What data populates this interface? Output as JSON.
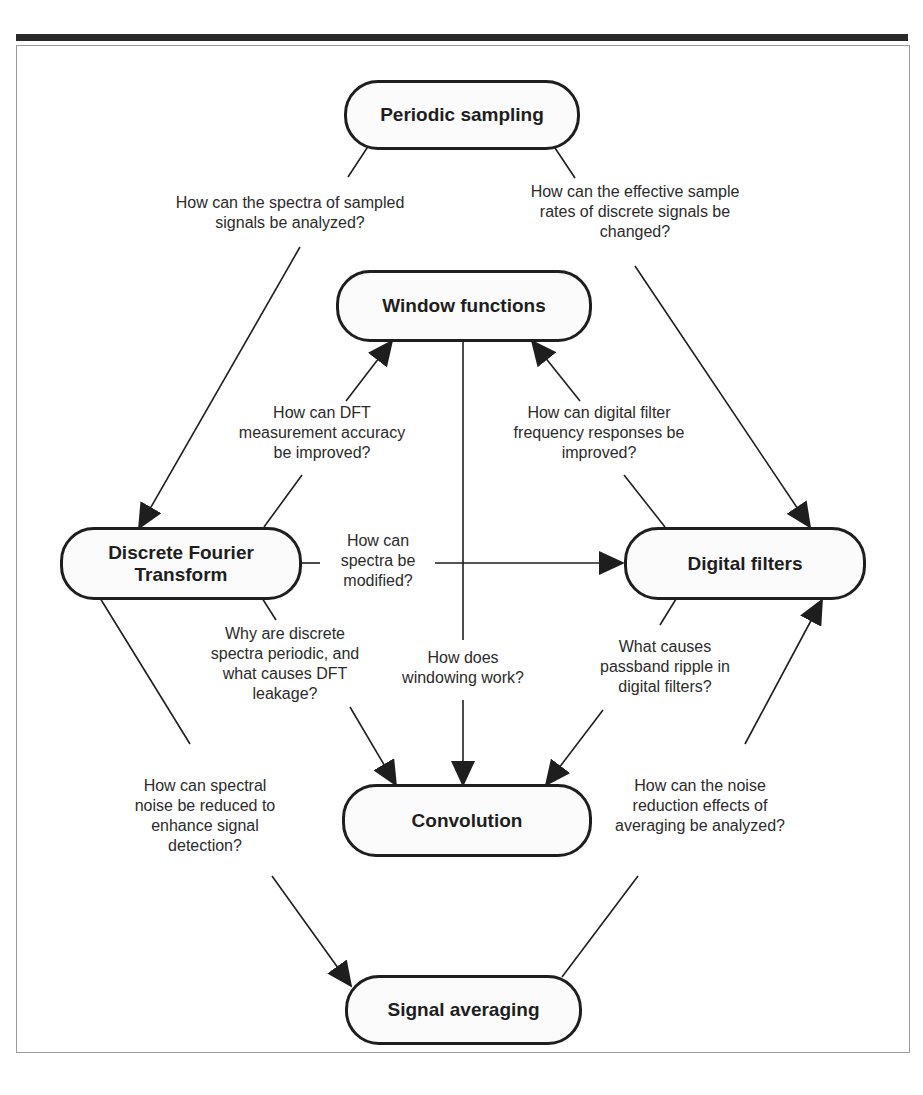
{
  "diagram": {
    "nodes": {
      "periodic_sampling": "Periodic sampling",
      "window_functions": "Window functions",
      "dft_line1": "Discrete Fourier",
      "dft_line2": "Transform",
      "digital_filters": "Digital filters",
      "convolution": "Convolution",
      "signal_averaging": "Signal averaging"
    },
    "questions": {
      "q_spectra_sampled": [
        "How can the spectra of sampled",
        "signals be analyzed?"
      ],
      "q_sample_rates": [
        "How can the effective sample",
        "rates of discrete signals be",
        "changed?"
      ],
      "q_dft_accuracy": [
        "How can DFT",
        "measurement accuracy",
        "be improved?"
      ],
      "q_filter_response": [
        "How can digital filter",
        "frequency responses be",
        "improved?"
      ],
      "q_spectra_modified": [
        "How can",
        "spectra be",
        "modified?"
      ],
      "q_periodic_leakage": [
        "Why are discrete",
        "spectra periodic, and",
        "what causes DFT",
        "leakage?"
      ],
      "q_windowing": [
        "How does",
        "windowing work?"
      ],
      "q_passband_ripple": [
        "What causes",
        "passband ripple in",
        "digital filters?"
      ],
      "q_spectral_noise": [
        "How can spectral",
        "noise be reduced to",
        "enhance signal",
        "detection?"
      ],
      "q_noise_reduction": [
        "How can the noise",
        "reduction effects of",
        "averaging be analyzed?"
      ]
    },
    "edges": [
      {
        "from": "Periodic sampling",
        "to": "Discrete Fourier Transform",
        "label": "q_spectra_sampled"
      },
      {
        "from": "Periodic sampling",
        "to": "Digital filters",
        "label": "q_sample_rates"
      },
      {
        "from": "Discrete Fourier Transform",
        "to": "Window functions",
        "label": "q_dft_accuracy"
      },
      {
        "from": "Digital filters",
        "to": "Window functions",
        "label": "q_filter_response"
      },
      {
        "from": "Discrete Fourier Transform",
        "to": "Digital filters",
        "label": "q_spectra_modified"
      },
      {
        "from": "Discrete Fourier Transform",
        "to": "Convolution",
        "label": "q_periodic_leakage"
      },
      {
        "from": "Window functions",
        "to": "Convolution",
        "label": "q_windowing"
      },
      {
        "from": "Digital filters",
        "to": "Convolution",
        "label": "q_passband_ripple"
      },
      {
        "from": "Discrete Fourier Transform",
        "to": "Signal averaging",
        "label": "q_spectral_noise"
      },
      {
        "from": "Signal averaging",
        "to": "Digital filters",
        "label": "q_noise_reduction"
      }
    ]
  }
}
